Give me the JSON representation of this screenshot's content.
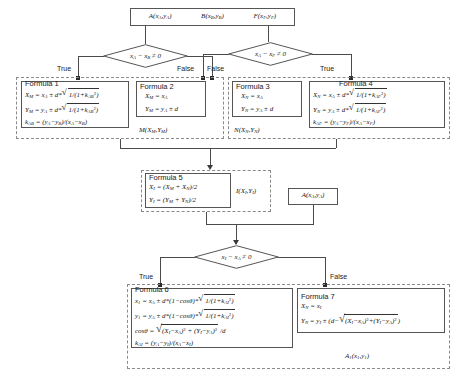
{
  "diagram": {
    "type": "flowchart"
  },
  "nodes": {
    "start": {
      "name": "input-points-box",
      "items": [
        {
          "fn": "A",
          "args": "x_A , y_A"
        },
        {
          "fn": "B",
          "args": "x_B , y_B"
        },
        {
          "fn": "F",
          "args": "x_F , y_F"
        }
      ]
    },
    "decision_ab": {
      "condition": "x_A - x_B ≠ 0",
      "true_label": "True",
      "false_label": "False"
    },
    "decision_af": {
      "condition": "x_A - x_F ≠ 0",
      "true_label": "True",
      "false_label": "False"
    },
    "decision_ia": {
      "condition": "x_I - x_A ≠ 0",
      "true_label": "True",
      "false_label": "False"
    },
    "point_a_mid": {
      "label": "A( x_A , y_A )"
    },
    "result_m": {
      "label": "M( X_M , Y_M )"
    },
    "result_n": {
      "label": "N( X_N , Y_N )"
    },
    "result_i": {
      "label": "I( X_I , Y_I )"
    },
    "result_a1": {
      "label": "A_1( x_1 , y_1 )"
    }
  },
  "formulas": {
    "f1": {
      "title": "Formula 1",
      "lines": [
        "X_M = x_A ± d * √( 1/(1+k²_AB) )",
        "Y_M = y_A ± d * √( 1/(1+k²_AB) )",
        "k_AB = (y_A - y_B)/(x_A - x_B)"
      ]
    },
    "f2": {
      "title": "Formula 2",
      "lines": [
        "X_M = x_A",
        "Y_M = y_A ± d"
      ]
    },
    "f3": {
      "title": "Formula  3",
      "lines": [
        "X_N = x_A",
        "Y_N = y_A ± d"
      ]
    },
    "f4": {
      "title": "Formula 4",
      "lines": [
        "X_N = x_A ± d * √( 1/(1+k²_AF) )",
        "Y_N = y_A ± d * √( 1/(1+k²_AF) )",
        "k_AF = (y_A - y_F)/(x_A - x_F)"
      ]
    },
    "f5": {
      "title": "Formula 5",
      "lines": [
        "X_I = (X_M + X_N)/2",
        "Y_I = (Y_M + Y_N)/2"
      ]
    },
    "f6": {
      "title": "Formula 6",
      "lines": [
        "x_1 = x_A ± d * (1-cosθ) * √( 1/(1+k²_AI) )",
        "y_1 = y_A ± d * (1-cosθ) * √( 1/(1+k²_AI) )",
        "cosθ = √( (X_I - x_A)² + (Y_I - y_A)² ) / d",
        "k_AI = (y_A - y_I)/(x_A - x_I)"
      ]
    },
    "f7": {
      "title": "Formula 7",
      "lines": [
        "X_N = x_I",
        "Y_N = y_I ± ( d - √( (X_I - x_A)² + (Y_I - y_A)² ) )"
      ]
    }
  }
}
